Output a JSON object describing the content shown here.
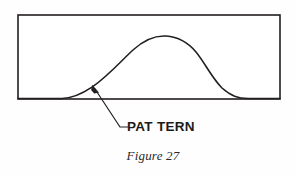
{
  "figure": {
    "caption": "Figure 27",
    "callout_label": "PAT TERN",
    "stroke_color": "#231f20",
    "fill_color": "#ffffff",
    "background_color": "#fefefe",
    "panel": {
      "name": "rectangular-border",
      "left": 18,
      "top": 15,
      "right": 280,
      "bottom": 99,
      "stroke_width": 1.6
    },
    "pattern_curve": {
      "name": "pattern-profile-curve",
      "description": "S-shaped pattern profile rising from the lower left, cresting near the middle, and descending back to the base line on the right",
      "path": "M 18 98.5 L 62 98.5 C 72 98.4 80 95 92 87 C 108 76 120 62 133 50 C 145 39 156 35.5 166 36 C 178 36.6 188 42 196 52 C 205 63 212 78 222 88 C 231 96 238 98.4 248 98.5 L 280 98.5",
      "stroke_width": 1.6
    },
    "leader": {
      "name": "callout-leader-line",
      "arrow_tip_x": 93,
      "arrow_tip_y": 85,
      "elbow_x": 120,
      "elbow_y": 127,
      "end_x": 128,
      "end_y": 127,
      "stroke_width": 1.2
    }
  }
}
